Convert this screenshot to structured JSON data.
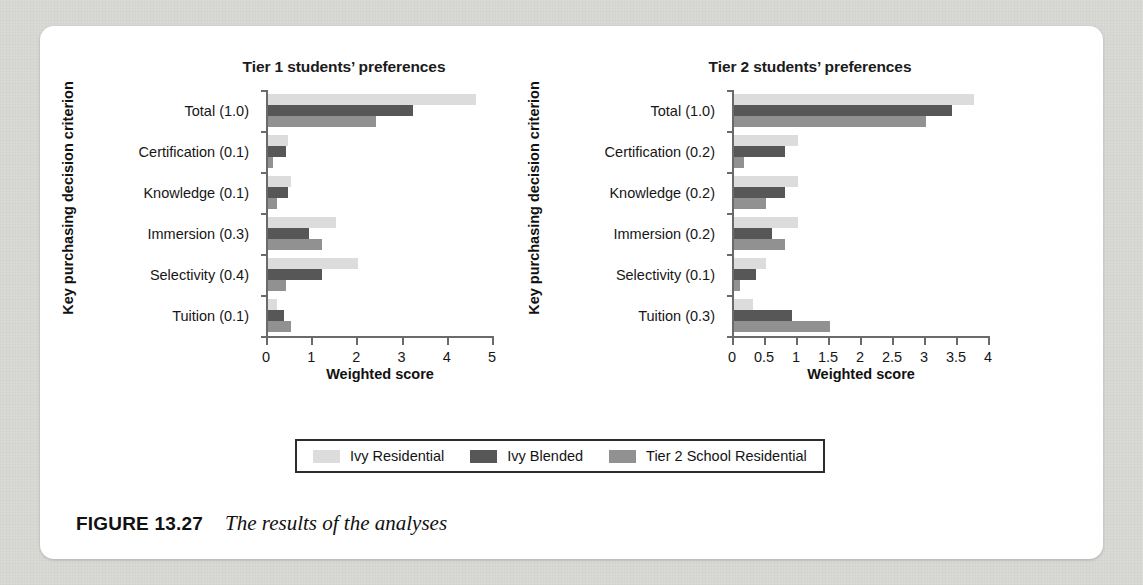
{
  "figure": {
    "caption_label": "FIGURE 13.27",
    "caption_text": "The results of the analyses"
  },
  "legend": {
    "entries": [
      {
        "label": "Ivy Residential",
        "color": "#dcdcdc"
      },
      {
        "label": "Ivy Blended",
        "color": "#575757"
      },
      {
        "label": "Tier 2 School Residential",
        "color": "#919191"
      }
    ]
  },
  "colors": {
    "ivy_residential": "#dcdcdc",
    "ivy_blended": "#575757",
    "tier2_residential": "#919191",
    "axis": "#6a6a6a",
    "text": "#161616"
  },
  "chart_data": [
    {
      "type": "bar",
      "orientation": "horizontal",
      "title": "Tier 1 students’ preferences",
      "xlabel": "Weighted score",
      "ylabel": "Key purchasing decision criterion",
      "categories": [
        "Total (1.0)",
        "Certification (0.1)",
        "Knowledge (0.1)",
        "Immersion (0.3)",
        "Selectivity (0.4)",
        "Tuition (0.1)"
      ],
      "xlim": [
        0,
        5
      ],
      "xticks": [
        "0",
        "1",
        "2",
        "3",
        "4",
        "5"
      ],
      "grid": false,
      "legend_position": "bottom",
      "series": [
        {
          "name": "Ivy Residential",
          "values": [
            4.6,
            0.45,
            0.5,
            1.5,
            2.0,
            0.2
          ]
        },
        {
          "name": "Ivy Blended",
          "values": [
            3.2,
            0.4,
            0.45,
            0.9,
            1.2,
            0.35
          ]
        },
        {
          "name": "Tier 2 School Residential",
          "values": [
            2.4,
            0.1,
            0.2,
            1.2,
            0.4,
            0.5
          ]
        }
      ]
    },
    {
      "type": "bar",
      "orientation": "horizontal",
      "title": "Tier 2 students’ preferences",
      "xlabel": "Weighted score",
      "ylabel": "Key purchasing decision criterion",
      "categories": [
        "Total (1.0)",
        "Certification (0.2)",
        "Knowledge (0.2)",
        "Immersion (0.2)",
        "Selectivity (0.1)",
        "Tuition (0.3)"
      ],
      "xlim": [
        0,
        4
      ],
      "xticks": [
        "0",
        "0.5",
        "1",
        "1.5",
        "2",
        "2.5",
        "3",
        "3.5",
        "4"
      ],
      "grid": false,
      "legend_position": "bottom",
      "series": [
        {
          "name": "Ivy Residential",
          "values": [
            3.75,
            1.0,
            1.0,
            1.0,
            0.5,
            0.3
          ]
        },
        {
          "name": "Ivy Blended",
          "values": [
            3.4,
            0.8,
            0.8,
            0.6,
            0.35,
            0.9
          ]
        },
        {
          "name": "Tier 2 School Residential",
          "values": [
            3.0,
            0.15,
            0.5,
            0.8,
            0.1,
            1.5
          ]
        }
      ]
    }
  ]
}
